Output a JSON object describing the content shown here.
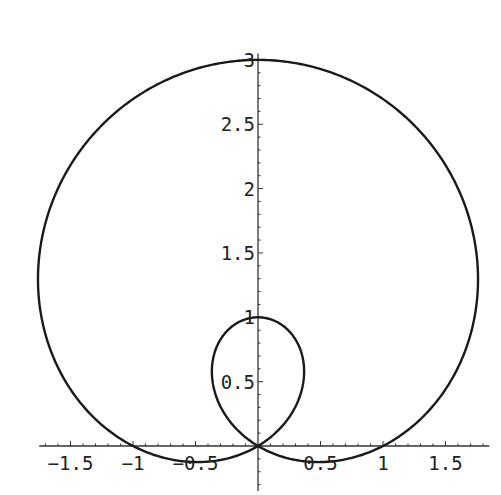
{
  "chart_data": {
    "type": "line",
    "title": "",
    "equation": "r = 1 + 2 sin(θ)",
    "xlabel": "",
    "ylabel": "",
    "xlim": [
      -1.75,
      1.85
    ],
    "ylim": [
      -0.35,
      3.05
    ],
    "x_ticks": [
      -1.5,
      -1,
      -0.5,
      0.5,
      1,
      1.5
    ],
    "x_tick_labels": [
      "-1.5",
      "-1",
      "-0.5",
      "0.5",
      "1",
      "1.5"
    ],
    "y_ticks": [
      0.5,
      1,
      1.5,
      2,
      2.5,
      3
    ],
    "y_tick_labels": [
      "0.5",
      "1",
      "1.5",
      "2",
      "2.5",
      "3"
    ],
    "grid": false,
    "legend": null,
    "series": [
      {
        "name": "r = 1 + 2 sin(θ)",
        "key_points": [
          {
            "x": 0,
            "y": 3
          },
          {
            "x": 0,
            "y": 1
          },
          {
            "x": 0,
            "y": 0
          },
          {
            "x": 1,
            "y": 0
          },
          {
            "x": -1,
            "y": 0
          },
          {
            "x": 1.76,
            "y": 1.3
          },
          {
            "x": -1.76,
            "y": 1.3
          },
          {
            "x": 0.34,
            "y": 0.6
          },
          {
            "x": -0.34,
            "y": 0.6
          },
          {
            "x": 0.5,
            "y": -0.25
          },
          {
            "x": -0.5,
            "y": -0.25
          }
        ],
        "color": "#1a1a1a"
      }
    ]
  },
  "axes": {
    "x_labels": [
      "-1.5",
      "-1",
      "-0.5",
      "0.5",
      "1",
      "1.5"
    ],
    "y_labels": [
      "0.5",
      "1",
      "1.5",
      "2",
      "2.5",
      "3"
    ]
  }
}
